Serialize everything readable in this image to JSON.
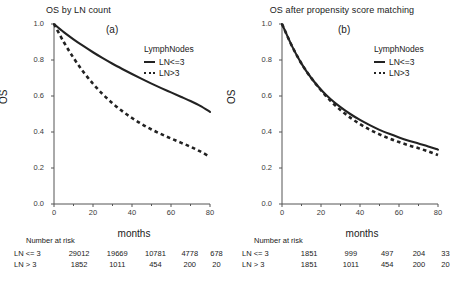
{
  "figure": {
    "panels": [
      {
        "letter": "(a)",
        "title": "OS by LN count",
        "xlabel": "months",
        "ylabel": "OS",
        "legend_title": "LymphNodes",
        "legend": [
          {
            "label": "LN<=3",
            "style": "solid"
          },
          {
            "label": "LN>3",
            "style": "dashed"
          }
        ],
        "risk_title": "Number at risk",
        "risk_rows": [
          {
            "label": "LN <= 3",
            "values": [
              "29012",
              "19669",
              "10781",
              "4778",
              "678"
            ]
          },
          {
            "label": "LN > 3",
            "values": [
              "1852",
              "1011",
              "454",
              "200",
              "20"
            ]
          }
        ]
      },
      {
        "letter": "(b)",
        "title": "OS after propensity score matching",
        "xlabel": "months",
        "ylabel": "OS",
        "legend_title": "LymphNodes",
        "legend": [
          {
            "label": "LN<=3",
            "style": "solid"
          },
          {
            "label": "LN>3",
            "style": "dashed"
          }
        ],
        "risk_title": "Number at risk",
        "risk_rows": [
          {
            "label": "LN <= 3",
            "values": [
              "1851",
              "999",
              "497",
              "204",
              "33"
            ]
          },
          {
            "label": "LN > 3",
            "values": [
              "1851",
              "1011",
              "454",
              "200",
              "20"
            ]
          }
        ]
      }
    ],
    "axis": {
      "yticks": [
        "0.0",
        "0.2",
        "0.4",
        "0.6",
        "0.8",
        "1.0"
      ],
      "ytick_values": [
        0.0,
        0.2,
        0.4,
        0.6,
        0.8,
        1.0
      ],
      "xticks": [
        "0",
        "20",
        "40",
        "60",
        "80"
      ],
      "xtick_values": [
        0,
        20,
        40,
        60,
        80
      ],
      "xminor_values": [
        10,
        30,
        50,
        70
      ],
      "xlim": [
        0,
        80
      ],
      "ylim": [
        0,
        1
      ]
    },
    "colors": {
      "curve": "#222222",
      "axis": "#555555",
      "text": "#1a1a1a",
      "background": "#ffffff"
    }
  },
  "chart_data": [
    {
      "type": "line",
      "title": "OS by LN count",
      "panel": "(a)",
      "xlabel": "months",
      "ylabel": "OS",
      "xlim": [
        0,
        80
      ],
      "ylim": [
        0,
        1
      ],
      "grid": false,
      "legend_title": "LymphNodes",
      "legend_position": "top-right inside",
      "x": [
        0,
        5,
        10,
        15,
        20,
        25,
        30,
        35,
        40,
        45,
        50,
        55,
        60,
        65,
        70,
        75,
        80
      ],
      "series": [
        {
          "name": "LN<=3",
          "style": "solid",
          "values": [
            1.0,
            0.955,
            0.915,
            0.878,
            0.843,
            0.81,
            0.779,
            0.75,
            0.722,
            0.695,
            0.669,
            0.644,
            0.62,
            0.596,
            0.572,
            0.545,
            0.512
          ]
        },
        {
          "name": "LN>3",
          "style": "dashed",
          "values": [
            1.0,
            0.9,
            0.812,
            0.735,
            0.668,
            0.61,
            0.56,
            0.516,
            0.478,
            0.444,
            0.414,
            0.388,
            0.364,
            0.341,
            0.318,
            0.292,
            0.262
          ]
        }
      ],
      "risk_table": {
        "times": [
          0,
          20,
          40,
          60,
          80
        ],
        "rows": [
          {
            "label": "LN <= 3",
            "values": [
              29012,
              19669,
              10781,
              4778,
              678
            ]
          },
          {
            "label": "LN > 3",
            "values": [
              1852,
              1011,
              454,
              200,
              20
            ]
          }
        ]
      }
    },
    {
      "type": "line",
      "title": "OS after propensity score matching",
      "panel": "(b)",
      "xlabel": "months",
      "ylabel": "OS",
      "xlim": [
        0,
        80
      ],
      "ylim": [
        0,
        1
      ],
      "grid": false,
      "legend_title": "LymphNodes",
      "legend_position": "top-right inside",
      "x": [
        0,
        5,
        10,
        15,
        20,
        25,
        30,
        35,
        40,
        45,
        50,
        55,
        60,
        65,
        70,
        75,
        80
      ],
      "series": [
        {
          "name": "LN<=3",
          "style": "solid",
          "values": [
            1.0,
            0.88,
            0.78,
            0.7,
            0.635,
            0.582,
            0.538,
            0.5,
            0.467,
            0.438,
            0.412,
            0.39,
            0.37,
            0.352,
            0.336,
            0.32,
            0.302
          ]
        },
        {
          "name": "LN>3",
          "style": "dashed",
          "values": [
            1.0,
            0.88,
            0.78,
            0.7,
            0.632,
            0.572,
            0.522,
            0.48,
            0.444,
            0.413,
            0.387,
            0.364,
            0.344,
            0.326,
            0.31,
            0.292,
            0.272
          ]
        }
      ],
      "risk_table": {
        "times": [
          0,
          20,
          40,
          60,
          80
        ],
        "rows": [
          {
            "label": "LN <= 3",
            "values": [
              1851,
              999,
              497,
              204,
              33
            ]
          },
          {
            "label": "LN > 3",
            "values": [
              1851,
              1011,
              454,
              200,
              20
            ]
          }
        ]
      }
    }
  ]
}
